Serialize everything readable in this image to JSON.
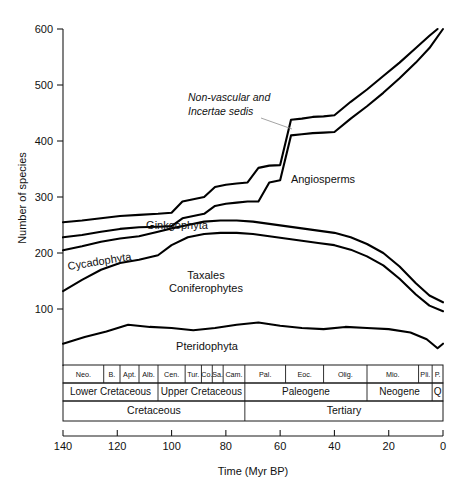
{
  "chart_data": {
    "type": "line",
    "title": "",
    "xlabel": "Time (Myr BP)",
    "ylabel": "Number of species",
    "xlim": [
      140,
      0
    ],
    "ylim": [
      0,
      620
    ],
    "x_ticks": [
      140,
      120,
      100,
      80,
      60,
      40,
      20,
      0
    ],
    "y_ticks": [
      100,
      200,
      300,
      400,
      500,
      600
    ],
    "grid": false,
    "legend": "none",
    "axis_note": "x axis reversed, time before present decreasing left to right",
    "series": [
      {
        "name": "Non-vascular and Incertae sedis (upper cumulative band)",
        "x": [
          140,
          133,
          126,
          119,
          112,
          105,
          100,
          96,
          92,
          88,
          84,
          80,
          76,
          72,
          68,
          64,
          60,
          56,
          52,
          48,
          44,
          40,
          34,
          28,
          22,
          16,
          10,
          5,
          2
        ],
        "y": [
          255,
          258,
          262,
          266,
          268,
          270,
          272,
          292,
          296,
          300,
          318,
          322,
          324,
          326,
          352,
          356,
          357,
          438,
          440,
          443,
          444,
          446,
          470,
          492,
          516,
          540,
          566,
          588,
          600
        ]
      },
      {
        "name": "Angiosperms (cumulative)",
        "x": [
          140,
          133,
          126,
          119,
          112,
          105,
          100,
          96,
          92,
          88,
          84,
          80,
          76,
          72,
          68,
          64,
          60,
          56,
          52,
          48,
          44,
          40,
          34,
          28,
          22,
          16,
          10,
          5,
          0
        ],
        "y": [
          228,
          232,
          238,
          243,
          246,
          247,
          248,
          262,
          266,
          270,
          284,
          288,
          290,
          292,
          292,
          326,
          330,
          410,
          412,
          414,
          415,
          416,
          440,
          462,
          486,
          512,
          540,
          566,
          600
        ]
      },
      {
        "name": "Ginkgophyta (cumulative)",
        "x": [
          140,
          133,
          126,
          119,
          112,
          105,
          100,
          94,
          88,
          82,
          76,
          70,
          64,
          58,
          52,
          46,
          40,
          34,
          28,
          22,
          16,
          10,
          5,
          0
        ],
        "y": [
          205,
          212,
          220,
          226,
          230,
          238,
          244,
          250,
          256,
          258,
          258,
          256,
          252,
          248,
          244,
          240,
          236,
          228,
          216,
          200,
          176,
          146,
          124,
          112
        ]
      },
      {
        "name": "Taxales / Coniferophytes (cumulative)",
        "x": [
          140,
          133,
          126,
          119,
          112,
          105,
          100,
          94,
          88,
          82,
          76,
          70,
          64,
          58,
          52,
          46,
          40,
          34,
          28,
          22,
          16,
          10,
          5,
          0
        ],
        "y": [
          132,
          152,
          170,
          182,
          188,
          196,
          214,
          228,
          234,
          236,
          236,
          234,
          230,
          226,
          222,
          218,
          214,
          206,
          194,
          178,
          154,
          126,
          106,
          96
        ]
      },
      {
        "name": "Pteridophyta",
        "x": [
          140,
          132,
          124,
          116,
          108,
          100,
          92,
          84,
          76,
          68,
          60,
          52,
          44,
          36,
          28,
          20,
          12,
          6,
          2,
          0
        ],
        "y": [
          38,
          50,
          60,
          72,
          68,
          66,
          62,
          66,
          72,
          76,
          70,
          66,
          64,
          68,
          66,
          64,
          58,
          46,
          30,
          38
        ]
      }
    ],
    "annotations": [
      {
        "text_line1": "Non-vascular and",
        "text_line2": "Incertae sedis",
        "italic": true,
        "points_to_x": 57,
        "points_to_y": 432
      },
      {
        "text": "Angiosperms",
        "italic": false
      },
      {
        "text": "Ginkgophyta",
        "italic": false
      },
      {
        "text": "Cycadophyta",
        "italic": false
      },
      {
        "text_line1": "Taxales",
        "text_line2": "Coniferophytes",
        "italic": false
      },
      {
        "text": "Pteridophyta",
        "italic": false
      }
    ],
    "stratigraphy": {
      "row1_label": "stage",
      "row1": [
        {
          "label": "Neo.",
          "start": 140,
          "end": 125
        },
        {
          "label": "B.",
          "start": 125,
          "end": 119
        },
        {
          "label": "Apt.",
          "start": 119,
          "end": 112
        },
        {
          "label": "Alb.",
          "start": 112,
          "end": 105
        },
        {
          "label": "Cen.",
          "start": 105,
          "end": 95
        },
        {
          "label": "Tur.",
          "start": 95,
          "end": 89
        },
        {
          "label": "Co.",
          "start": 89,
          "end": 85
        },
        {
          "label": "Sa.",
          "start": 85,
          "end": 81
        },
        {
          "label": "Cam.",
          "start": 81,
          "end": 73
        },
        {
          "label": "Pal.",
          "start": 73,
          "end": 58
        },
        {
          "label": "Eoc.",
          "start": 58,
          "end": 44
        },
        {
          "label": "Olig.",
          "start": 44,
          "end": 28
        },
        {
          "label": "Mio.",
          "start": 28,
          "end": 9
        },
        {
          "label": "Pli.",
          "start": 9,
          "end": 4
        },
        {
          "label": "P.",
          "start": 4,
          "end": 0
        }
      ],
      "row2": [
        {
          "label": "Lower Cretaceous",
          "start": 140,
          "end": 105
        },
        {
          "label": "Upper Cretaceous",
          "start": 105,
          "end": 73
        },
        {
          "label": "Paleogene",
          "start": 73,
          "end": 28
        },
        {
          "label": "Neogene",
          "start": 28,
          "end": 4
        },
        {
          "label": "Q",
          "start": 4,
          "end": 0
        }
      ],
      "row3": [
        {
          "label": "Cretaceous",
          "start": 140,
          "end": 73
        },
        {
          "label": "Tertiary",
          "start": 73,
          "end": 0
        }
      ]
    }
  },
  "figure": {
    "ylabel": "Number of species",
    "xlabel": "Time (Myr BP)"
  }
}
